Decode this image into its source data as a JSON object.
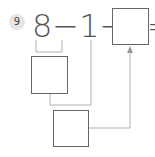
{
  "problem": {
    "number": "9",
    "expression": "8−1−5=",
    "answer_value": "",
    "step1_value": "",
    "step2_value": ""
  },
  "colors": {
    "box_border": "#666666",
    "connector": "#b0b0b0",
    "badge_bg": "#e6e6e6"
  }
}
